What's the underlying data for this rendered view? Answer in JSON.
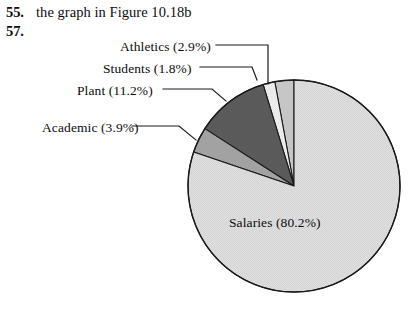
{
  "exercises": [
    {
      "number": "55.",
      "text": "the graph in Figure 10.18b"
    },
    {
      "number": "57.",
      "text": ""
    }
  ],
  "chart_data": {
    "type": "pie",
    "title": "",
    "subtitle": "",
    "xlabel": "",
    "ylabel": "",
    "legend_position": "callout-labels",
    "grid": false,
    "start_angle_deg": 90,
    "direction": "counterclockwise",
    "categories": [
      "Athletics",
      "Students",
      "Plant",
      "Academic",
      "Salaries"
    ],
    "values": [
      2.9,
      1.8,
      11.2,
      3.9,
      80.2
    ],
    "units": "percent",
    "slices": [
      {
        "name": "Athletics",
        "value": 2.9,
        "label": "Athletics (2.9%)",
        "color": "#c9c9c9",
        "callout": true
      },
      {
        "name": "Students",
        "value": 1.8,
        "label": "Students (1.8%)",
        "color": "#efefef",
        "callout": true
      },
      {
        "name": "Plant",
        "value": 11.2,
        "label": "Plant (11.2%)",
        "color": "#5c5c5c",
        "callout": true
      },
      {
        "name": "Academic",
        "value": 3.9,
        "label": "Academic (3.9%)",
        "color": "#a5a5a5",
        "callout": true
      },
      {
        "name": "Salaries",
        "value": 80.2,
        "label": "Salaries (80.2%)",
        "color": "#dedede",
        "callout": false
      }
    ],
    "outline_color": "#1a1a1a"
  },
  "labels": {
    "athletics": "Athletics (2.9%)",
    "students": "Students (1.8%)",
    "plant": "Plant (11.2%)",
    "academic": "Academic (3.9%)",
    "salaries": "Salaries (80.2%)"
  }
}
